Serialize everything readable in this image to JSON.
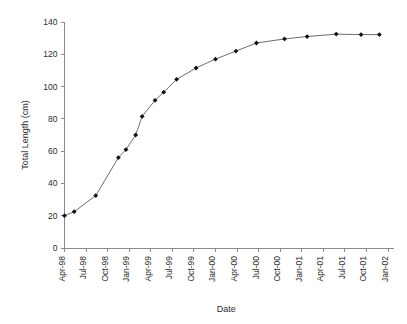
{
  "chart_data": {
    "type": "line",
    "title": "",
    "subtitle": "",
    "xlabel": "Date",
    "ylabel": "Total Length (cm)",
    "ylim": [
      0,
      140
    ],
    "yticks": [
      0,
      20,
      40,
      60,
      80,
      100,
      120,
      140
    ],
    "ytick_labels": [
      "0",
      "20",
      "40",
      "60",
      "80",
      "100",
      "120",
      "140"
    ],
    "xtick_labels": [
      "Apr-98",
      "Jul-98",
      "Oct-98",
      "Jan-99",
      "Apr-99",
      "Jul-99",
      "Oct-99",
      "Jan-00",
      "Apr-00",
      "Jul-00",
      "Oct-00",
      "Jan-01",
      "Apr-01",
      "Jul-01",
      "Oct-01",
      "Jan-02"
    ],
    "grid": false,
    "legend": false,
    "legend_position": "none",
    "marker": "filled-diamond",
    "line_color": "#6e6e6e",
    "marker_color": "#111111",
    "series": [
      {
        "name": "Total Length",
        "x": [
          "Apr-98",
          "May-98",
          "Aug-98",
          "Nov-98",
          "Dec-98",
          "Jan-99",
          "Feb-99",
          "Mar-99",
          "Apr-99",
          "May-99",
          "Jul-99",
          "Sep-99",
          "Nov-99",
          "Jan-00",
          "Mar-00",
          "May-00",
          "Jul-00",
          "Nov-00",
          "Feb-01",
          "May-01",
          "Sep-01",
          "Dec-01",
          "Jan-02"
        ],
        "values": [
          20,
          22.5,
          32.5,
          56,
          61,
          70,
          81.5,
          91.5,
          96.5,
          104.5,
          111.5,
          117,
          122,
          127,
          129.5,
          131,
          132.5,
          132,
          132,
          132,
          132,
          132,
          132
        ]
      }
    ],
    "data_points": [
      {
        "x": "Apr-98",
        "xpos": 0.0,
        "y": 20.0
      },
      {
        "x": "May-98",
        "xpos": 0.45,
        "y": 22.5
      },
      {
        "x": "Aug-98",
        "xpos": 1.45,
        "y": 32.5
      },
      {
        "x": "Nov-98",
        "xpos": 2.5,
        "y": 56.0
      },
      {
        "x": "Dec-98",
        "xpos": 2.85,
        "y": 61.0
      },
      {
        "x": "Feb-99",
        "xpos": 3.3,
        "y": 70.0
      },
      {
        "x": "Mar-99",
        "xpos": 3.6,
        "y": 81.5
      },
      {
        "x": "May-99",
        "xpos": 4.2,
        "y": 91.5
      },
      {
        "x": "Jun-99",
        "xpos": 4.6,
        "y": 96.5
      },
      {
        "x": "Aug-99",
        "xpos": 5.2,
        "y": 104.5
      },
      {
        "x": "Nov-99",
        "xpos": 6.1,
        "y": 111.5
      },
      {
        "x": "Feb-00",
        "xpos": 7.0,
        "y": 117.0
      },
      {
        "x": "May-00",
        "xpos": 7.95,
        "y": 122.0
      },
      {
        "x": "Jul-00",
        "xpos": 8.9,
        "y": 127.0
      },
      {
        "x": "Nov-00",
        "xpos": 10.2,
        "y": 129.5
      },
      {
        "x": "Feb-01",
        "xpos": 11.25,
        "y": 131.0
      },
      {
        "x": "Jun-01",
        "xpos": 12.6,
        "y": 132.5
      },
      {
        "x": "Oct-01",
        "xpos": 13.75,
        "y": 132.2
      },
      {
        "x": "Jan-02",
        "xpos": 14.6,
        "y": 132.2
      }
    ]
  }
}
